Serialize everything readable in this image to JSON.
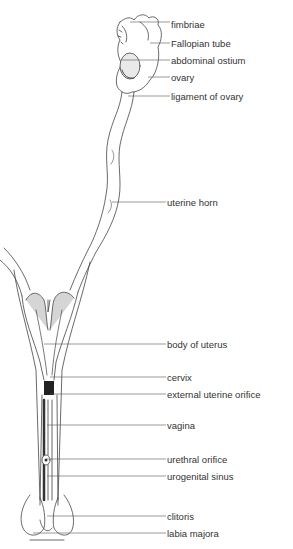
{
  "figure": {
    "labels": [
      {
        "text": "fimbriae",
        "x": 170,
        "y": 19,
        "lx1": 130,
        "ly1": 22
      },
      {
        "text": "Fallopian tube",
        "x": 170,
        "y": 38,
        "lx1": 150,
        "ly1": 43
      },
      {
        "text": "abdominal ostium",
        "x": 170,
        "y": 55,
        "lx1": 122,
        "ly1": 60
      },
      {
        "text": "ovary",
        "x": 170,
        "y": 72,
        "lx1": 148,
        "ly1": 77
      },
      {
        "text": "ligament of ovary",
        "x": 170,
        "y": 91,
        "lx1": 128,
        "ly1": 96
      },
      {
        "text": "uterine horn",
        "x": 166,
        "y": 197,
        "lx1": 112,
        "ly1": 202
      },
      {
        "text": "body of uterus",
        "x": 166,
        "y": 339,
        "lx1": 44,
        "ly1": 344
      },
      {
        "text": "cervix",
        "x": 166,
        "y": 372,
        "lx1": 50,
        "ly1": 377
      },
      {
        "text": "external uterine orifice",
        "x": 166,
        "y": 389,
        "lx1": 50,
        "ly1": 394
      },
      {
        "text": "vagina",
        "x": 166,
        "y": 420,
        "lx1": 47,
        "ly1": 425
      },
      {
        "text": "urethral orifice",
        "x": 166,
        "y": 454,
        "lx1": 47,
        "ly1": 459
      },
      {
        "text": "urogenital sinus",
        "x": 166,
        "y": 471,
        "lx1": 47,
        "ly1": 476
      },
      {
        "text": "clitoris",
        "x": 166,
        "y": 511,
        "lx1": 47,
        "ly1": 516
      },
      {
        "text": "labia majora",
        "x": 166,
        "y": 528,
        "lx1": 33,
        "ly1": 533
      }
    ]
  }
}
